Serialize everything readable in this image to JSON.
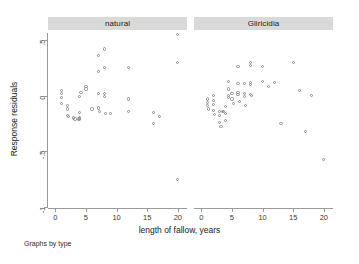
{
  "chart_data": {
    "type": "scatter",
    "title": "",
    "xlabel": "length of fallow, years",
    "ylabel": "Response residuals",
    "note": "Graphs by type",
    "xlim": [
      -1.2,
      21.5
    ],
    "ylim": [
      -1.0,
      0.62
    ],
    "xticks": [
      0,
      5,
      10,
      15,
      20
    ],
    "xticklabels": [
      "0",
      "5",
      "10",
      "15",
      "20"
    ],
    "yticks": [
      0.5,
      0,
      -0.5,
      -1
    ],
    "yticklabels": [
      ".5",
      "0",
      "-.5",
      "-1"
    ],
    "grid": false,
    "legend": "none",
    "facet_by": "type",
    "panels": [
      {
        "label": "natural",
        "points": [
          {
            "x": 1.0,
            "y": 0.05
          },
          {
            "x": 1.0,
            "y": 0.02
          },
          {
            "x": 1.0,
            "y": -0.02
          },
          {
            "x": 1.0,
            "y": -0.07
          },
          {
            "x": 2.0,
            "y": -0.09
          },
          {
            "x": 2.0,
            "y": -0.12
          },
          {
            "x": 2.0,
            "y": -0.18
          },
          {
            "x": 2.2,
            "y": -0.19
          },
          {
            "x": 3.0,
            "y": -0.2
          },
          {
            "x": 3.2,
            "y": -0.21
          },
          {
            "x": 3.8,
            "y": -0.21
          },
          {
            "x": 4.0,
            "y": -0.21
          },
          {
            "x": 4.0,
            "y": -0.2
          },
          {
            "x": 4.0,
            "y": -0.15
          },
          {
            "x": 4.0,
            "y": -0.01
          },
          {
            "x": 4.2,
            "y": 0.03
          },
          {
            "x": 5.0,
            "y": 0.08
          },
          {
            "x": 5.0,
            "y": 0.06
          },
          {
            "x": 6.0,
            "y": -0.12
          },
          {
            "x": 7.0,
            "y": 0.36
          },
          {
            "x": 7.0,
            "y": 0.22
          },
          {
            "x": 7.0,
            "y": 0.02
          },
          {
            "x": 7.0,
            "y": -0.11
          },
          {
            "x": 7.2,
            "y": -0.14
          },
          {
            "x": 8.0,
            "y": 0.42
          },
          {
            "x": 8.0,
            "y": 0.25
          },
          {
            "x": 8.0,
            "y": 0.02
          },
          {
            "x": 8.0,
            "y": -0.01
          },
          {
            "x": 8.2,
            "y": -0.16
          },
          {
            "x": 9.0,
            "y": -0.16
          },
          {
            "x": 12.0,
            "y": 0.25
          },
          {
            "x": 12.0,
            "y": -0.03
          },
          {
            "x": 12.0,
            "y": -0.14
          },
          {
            "x": 16.0,
            "y": -0.15
          },
          {
            "x": 16.0,
            "y": -0.25
          },
          {
            "x": 17.0,
            "y": -0.19
          },
          {
            "x": 20.0,
            "y": 0.55
          },
          {
            "x": 20.0,
            "y": 0.3
          },
          {
            "x": 20.0,
            "y": -0.75
          }
        ]
      },
      {
        "label": "Gliricidia",
        "points": [
          {
            "x": 1.0,
            "y": -0.03
          },
          {
            "x": 1.0,
            "y": -0.06
          },
          {
            "x": 1.0,
            "y": -0.09
          },
          {
            "x": 1.2,
            "y": -0.12
          },
          {
            "x": 2.0,
            "y": 0.0
          },
          {
            "x": 2.0,
            "y": -0.04
          },
          {
            "x": 2.0,
            "y": -0.08
          },
          {
            "x": 2.0,
            "y": -0.13
          },
          {
            "x": 2.2,
            "y": -0.17
          },
          {
            "x": 3.0,
            "y": -0.14
          },
          {
            "x": 3.0,
            "y": -0.18
          },
          {
            "x": 3.0,
            "y": -0.24
          },
          {
            "x": 3.2,
            "y": -0.28
          },
          {
            "x": 3.4,
            "y": -0.14
          },
          {
            "x": 3.6,
            "y": -0.14
          },
          {
            "x": 4.0,
            "y": -0.1
          },
          {
            "x": 4.0,
            "y": -0.16
          },
          {
            "x": 4.0,
            "y": -0.22
          },
          {
            "x": 4.5,
            "y": 0.13
          },
          {
            "x": 4.5,
            "y": 0.06
          },
          {
            "x": 4.5,
            "y": 0.0
          },
          {
            "x": 4.5,
            "y": -0.02
          },
          {
            "x": 5.0,
            "y": 0.02
          },
          {
            "x": 5.0,
            "y": -0.03
          },
          {
            "x": 5.2,
            "y": -0.07
          },
          {
            "x": 6.0,
            "y": 0.26
          },
          {
            "x": 6.0,
            "y": 0.11
          },
          {
            "x": 6.0,
            "y": 0.03
          },
          {
            "x": 6.0,
            "y": 0.01
          },
          {
            "x": 6.2,
            "y": -0.05
          },
          {
            "x": 7.0,
            "y": 0.11
          },
          {
            "x": 7.0,
            "y": 0.02
          },
          {
            "x": 7.0,
            "y": -0.01
          },
          {
            "x": 7.2,
            "y": -0.09
          },
          {
            "x": 8.0,
            "y": 0.3
          },
          {
            "x": 8.0,
            "y": 0.27
          },
          {
            "x": 8.0,
            "y": 0.12
          },
          {
            "x": 8.0,
            "y": 0.1
          },
          {
            "x": 8.0,
            "y": 0.01
          },
          {
            "x": 8.2,
            "y": 0.0
          },
          {
            "x": 10.0,
            "y": 0.26
          },
          {
            "x": 10.0,
            "y": 0.13
          },
          {
            "x": 11.0,
            "y": 0.08
          },
          {
            "x": 12.0,
            "y": 0.12
          },
          {
            "x": 13.0,
            "y": -0.25
          },
          {
            "x": 15.0,
            "y": 0.3
          },
          {
            "x": 16.0,
            "y": 0.05
          },
          {
            "x": 17.0,
            "y": -0.32
          },
          {
            "x": 18.0,
            "y": 0.0
          },
          {
            "x": 20.0,
            "y": -0.57
          }
        ]
      }
    ]
  },
  "colors": {
    "strip_background": "#d9d9d9",
    "marker_stroke": "#8c8c94",
    "axis": "#9a9a9a",
    "text": "#1a1a1a",
    "background": "#ffffff"
  }
}
